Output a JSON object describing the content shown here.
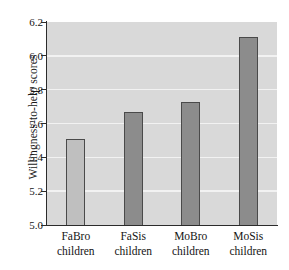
{
  "chart_data": {
    "type": "bar",
    "title": "",
    "xlabel": "",
    "ylabel": "Willingness-to-help scores",
    "categories": [
      "FaBro children",
      "FaSis children",
      "MoBro children",
      "MoSis children"
    ],
    "category_lines": [
      [
        "FaBro",
        "children"
      ],
      [
        "FaSis",
        "children"
      ],
      [
        "MoBro",
        "children"
      ],
      [
        "MoSis",
        "children"
      ]
    ],
    "values": [
      5.51,
      5.67,
      5.73,
      6.11
    ],
    "ylim": [
      5.0,
      6.2
    ],
    "yticks": [
      6.2,
      6.0,
      5.8,
      5.6,
      5.4,
      5.2,
      5.0
    ],
    "ytick_labels": [
      "6.2",
      "6.0",
      "5.8",
      "5.6",
      "5.4",
      "5.2",
      "5.0"
    ],
    "grid": true,
    "gridline_values": [
      6.0,
      5.8,
      5.6,
      5.4,
      5.2
    ],
    "legend": null,
    "bar_colors": [
      "#bfbfbf",
      "#8c8c8c",
      "#8c8c8c",
      "#8c8c8c"
    ],
    "bar_edge_color": "#4a4a4a",
    "plot_background": "#d9d9d9",
    "gridline_color": "#f2f2f2",
    "axis_color": "#2b2b2b",
    "figure_background": "#ffffff"
  }
}
